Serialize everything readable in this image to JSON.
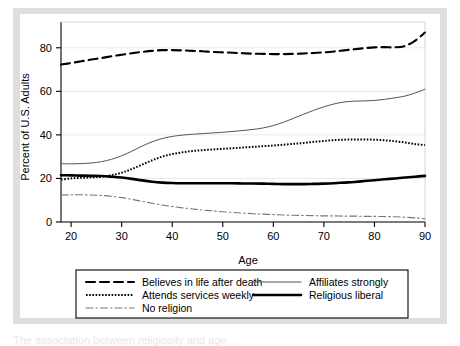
{
  "figure": {
    "background_color": "#dedede",
    "plot_background_color": "#ffffff",
    "caption_partial": "The association between religiosity and age"
  },
  "chart_data": {
    "type": "line",
    "title": "",
    "xlabel": "Age",
    "ylabel": "Percent of U.S. Adults",
    "xlim": [
      18,
      90
    ],
    "ylim": [
      0,
      90
    ],
    "xticks": [
      20,
      30,
      40,
      50,
      60,
      70,
      80,
      90
    ],
    "yticks": [
      0,
      20,
      40,
      60,
      80
    ],
    "grid": "horizontal-gridlines-at-yticks",
    "legend_position": "below-plot",
    "x": [
      18,
      20,
      22,
      24,
      26,
      28,
      30,
      32,
      34,
      36,
      38,
      40,
      42,
      44,
      46,
      48,
      50,
      52,
      54,
      56,
      58,
      60,
      62,
      64,
      66,
      68,
      70,
      72,
      74,
      76,
      78,
      80,
      82,
      84,
      86,
      88,
      90
    ],
    "series": [
      {
        "name": "Believes in life after death",
        "style": "dashed",
        "width": 2.1,
        "color": "#000000",
        "values": [
          72.3,
          73.0,
          73.8,
          74.6,
          75.3,
          76.1,
          76.8,
          77.5,
          78.1,
          78.6,
          78.9,
          78.9,
          78.8,
          78.6,
          78.4,
          78.1,
          77.9,
          77.7,
          77.5,
          77.3,
          77.2,
          77.1,
          77.1,
          77.2,
          77.4,
          77.6,
          77.9,
          78.3,
          78.8,
          79.3,
          79.8,
          80.2,
          80.3,
          80.2,
          80.8,
          83.2,
          87.0
        ]
      },
      {
        "name": "Affiliates strongly",
        "style": "solid",
        "width": 1.0,
        "color": "#555555",
        "values": [
          26.8,
          26.7,
          26.8,
          27.1,
          27.7,
          28.8,
          30.4,
          32.5,
          34.8,
          36.8,
          38.3,
          39.3,
          39.9,
          40.3,
          40.6,
          40.9,
          41.2,
          41.6,
          42.0,
          42.5,
          43.2,
          44.3,
          45.8,
          47.6,
          49.5,
          51.3,
          52.9,
          54.2,
          55.1,
          55.5,
          55.6,
          55.8,
          56.3,
          57.0,
          57.8,
          59.2,
          61.0
        ]
      },
      {
        "name": "Attends services weekly",
        "style": "dotted",
        "width": 2.0,
        "color": "#000000",
        "values": [
          19.5,
          20.0,
          20.3,
          20.5,
          20.8,
          21.5,
          22.6,
          24.3,
          26.3,
          28.3,
          30.0,
          31.2,
          32.0,
          32.6,
          33.0,
          33.3,
          33.6,
          33.9,
          34.2,
          34.5,
          34.8,
          35.1,
          35.5,
          35.9,
          36.3,
          36.8,
          37.2,
          37.6,
          37.8,
          37.9,
          37.9,
          37.8,
          37.5,
          37.1,
          36.5,
          35.8,
          35.3
        ]
      },
      {
        "name": "Religious liberal",
        "style": "solid",
        "width": 2.6,
        "color": "#000000",
        "values": [
          21.5,
          21.4,
          21.3,
          21.2,
          21.1,
          20.8,
          20.4,
          19.8,
          19.1,
          18.5,
          18.1,
          17.9,
          17.8,
          17.8,
          17.8,
          17.8,
          17.8,
          17.8,
          17.7,
          17.7,
          17.6,
          17.5,
          17.4,
          17.4,
          17.4,
          17.5,
          17.6,
          17.8,
          18.1,
          18.4,
          18.8,
          19.2,
          19.6,
          20.0,
          20.4,
          20.8,
          21.2
        ]
      },
      {
        "name": "No religion",
        "style": "dashdot",
        "width": 1.1,
        "color": "#777777",
        "values": [
          12.4,
          12.5,
          12.5,
          12.4,
          12.2,
          11.8,
          11.2,
          10.4,
          9.5,
          8.6,
          7.8,
          7.1,
          6.5,
          6.0,
          5.5,
          5.1,
          4.7,
          4.4,
          4.1,
          3.8,
          3.6,
          3.4,
          3.2,
          3.1,
          3.0,
          2.9,
          2.8,
          2.8,
          2.7,
          2.7,
          2.6,
          2.6,
          2.5,
          2.4,
          2.2,
          1.9,
          1.5
        ]
      }
    ],
    "legend": [
      {
        "label": "Believes in life after death",
        "style": "dashed",
        "column": 1
      },
      {
        "label": "Attends services weekly",
        "style": "dotted",
        "column": 1
      },
      {
        "label": "No religion",
        "style": "dashdot",
        "column": 1
      },
      {
        "label": "Affiliates strongly",
        "style": "solid-thin",
        "column": 2
      },
      {
        "label": "Religious liberal",
        "style": "solid-thick",
        "column": 2
      }
    ]
  }
}
